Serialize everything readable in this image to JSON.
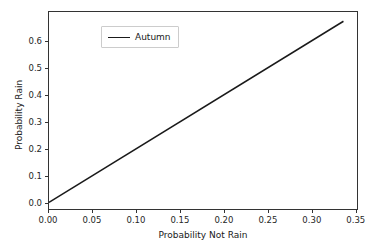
{
  "figure": {
    "background_color": "#ffffff",
    "top_cut_text": " . . . . .  . .  . . .  . . . . .  . . . . . .  . .  . . .  . .  . . . .  . . . ."
  },
  "chart_data": {
    "type": "line",
    "title": "",
    "xlabel": "Probability Not Rain",
    "ylabel": "Probability Rain",
    "xlim": [
      0.0,
      0.3525
    ],
    "ylim": [
      -0.0245,
      0.7105
    ],
    "xticks": [
      0.0,
      0.05,
      0.1,
      0.15,
      0.2,
      0.25,
      0.3,
      0.35
    ],
    "xticklabels": [
      "0.00",
      "0.05",
      "0.10",
      "0.15",
      "0.20",
      "0.25",
      "0.30",
      "0.35"
    ],
    "yticks": [
      0.0,
      0.1,
      0.2,
      0.3,
      0.4,
      0.5,
      0.6
    ],
    "yticklabels": [
      "0.0",
      "0.1",
      "0.2",
      "0.3",
      "0.4",
      "0.5",
      "0.6"
    ],
    "grid": false,
    "legend_position": "upper left",
    "series": [
      {
        "name": "Autumn",
        "color": "#1a1a1a",
        "linewidth": 1.5,
        "x": [
          0.0,
          0.337
        ],
        "y": [
          0.0,
          0.676
        ]
      }
    ]
  },
  "legend": {
    "entries": [
      {
        "label": "Autumn"
      }
    ]
  }
}
